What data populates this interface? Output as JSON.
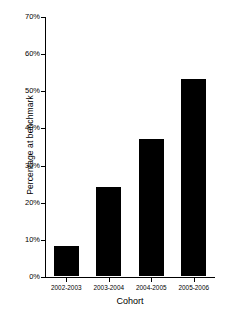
{
  "chart_data": {
    "type": "bar",
    "title": "",
    "xlabel": "Cohort",
    "ylabel": "Percentage at benchmark",
    "categories": [
      "2002-2003",
      "2003-2004",
      "2004-2005",
      "2005-2006"
    ],
    "values": [
      8,
      24,
      37,
      53
    ],
    "ylim": [
      0,
      70
    ],
    "y_ticks": [
      0,
      10,
      20,
      30,
      40,
      50,
      60,
      70
    ],
    "y_tick_labels": [
      "0%",
      "10%",
      "20%",
      "30%",
      "40%",
      "50%",
      "60%",
      "70%"
    ],
    "grid": false,
    "legend": false,
    "bar_color": "#000000",
    "background_color": "#ffffff",
    "axis_color": "#000000",
    "value_unit": "%"
  }
}
